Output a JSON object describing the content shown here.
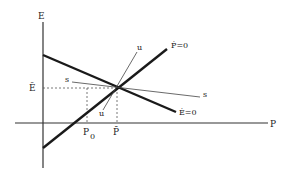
{
  "diagram": {
    "type": "phase-diagram",
    "axes": {
      "x_label": "P",
      "y_label": "E"
    },
    "curves": {
      "e_dot_zero": {
        "label": "Ė=0",
        "description": "downward sloping thick line"
      },
      "p_dot_zero": {
        "label": "Ṗ=0",
        "description": "upward sloping thick line"
      }
    },
    "saddle_paths": {
      "stable": {
        "label": "s"
      },
      "unstable": {
        "label": "u"
      }
    },
    "reference_values": {
      "e_bar": "Ē",
      "p_bar": "P̄",
      "p_zero": "P",
      "p_zero_sub": "0"
    },
    "colors": {
      "line": "#1a1a1a",
      "thin_line": "#444444",
      "dashed": "#555555",
      "background": "#ffffff"
    }
  }
}
